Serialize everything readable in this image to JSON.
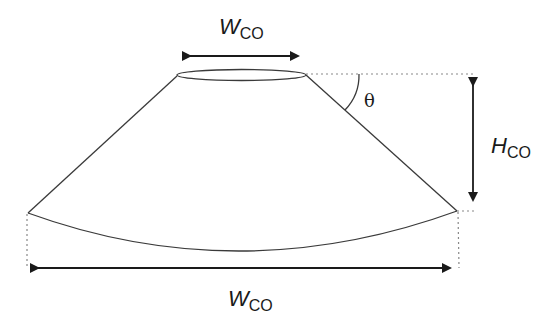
{
  "diagram": {
    "labels": {
      "top_width": {
        "main": "W",
        "sub": "CO"
      },
      "height": {
        "main": "H",
        "sub": "CO"
      },
      "bottom_width": {
        "main": "W",
        "sub": "CO"
      },
      "angle": "θ"
    },
    "colors": {
      "line": "#3a3a3a",
      "arrow": "#1a1a1a",
      "dotted": "#888888"
    }
  }
}
